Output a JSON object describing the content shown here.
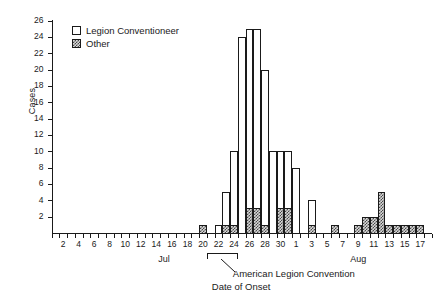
{
  "chart_data": {
    "type": "bar",
    "title": "",
    "xlabel": "Date of Onset",
    "ylabel": "Cases",
    "ylim": [
      0,
      26
    ],
    "ytick_step": 2,
    "grid": false,
    "legend_position": "top-left",
    "stacked": true,
    "legend": [
      "Legion Conventioneer",
      "Other"
    ],
    "x_axis_months": [
      {
        "label": "Jul",
        "start_day": 1,
        "end_day": 31
      },
      {
        "label": "Aug",
        "start_day": 1,
        "end_day": 18
      }
    ],
    "x_tick_labels": [
      "2",
      "4",
      "6",
      "8",
      "10",
      "12",
      "14",
      "16",
      "18",
      "20",
      "22",
      "24",
      "26",
      "28",
      "30",
      "1",
      "3",
      "5",
      "7",
      "9",
      "11",
      "13",
      "15",
      "17"
    ],
    "categories": [
      "Jul 1",
      "Jul 2",
      "Jul 3",
      "Jul 4",
      "Jul 5",
      "Jul 6",
      "Jul 7",
      "Jul 8",
      "Jul 9",
      "Jul 10",
      "Jul 11",
      "Jul 12",
      "Jul 13",
      "Jul 14",
      "Jul 15",
      "Jul 16",
      "Jul 17",
      "Jul 18",
      "Jul 19",
      "Jul 20",
      "Jul 21",
      "Jul 22",
      "Jul 23",
      "Jul 24",
      "Jul 25",
      "Jul 26",
      "Jul 27",
      "Jul 28",
      "Jul 29",
      "Jul 30",
      "Jul 31",
      "Aug 1",
      "Aug 2",
      "Aug 3",
      "Aug 4",
      "Aug 5",
      "Aug 6",
      "Aug 7",
      "Aug 8",
      "Aug 9",
      "Aug 10",
      "Aug 11",
      "Aug 12",
      "Aug 13",
      "Aug 14",
      "Aug 15",
      "Aug 16",
      "Aug 17",
      "Aug 18"
    ],
    "series": [
      {
        "name": "Other",
        "values": [
          0,
          0,
          0,
          0,
          0,
          0,
          0,
          0,
          0,
          0,
          0,
          0,
          0,
          0,
          0,
          0,
          0,
          0,
          0,
          1,
          0,
          0,
          1,
          1,
          0,
          3,
          3,
          1,
          0,
          3,
          3,
          0,
          0,
          1,
          0,
          0,
          1,
          0,
          0,
          1,
          2,
          2,
          5,
          1,
          1,
          1,
          1,
          1,
          0
        ]
      },
      {
        "name": "Legion Conventioneer",
        "values": [
          0,
          0,
          0,
          0,
          0,
          0,
          0,
          0,
          0,
          0,
          0,
          0,
          0,
          0,
          0,
          0,
          0,
          0,
          0,
          0,
          0,
          1,
          4,
          9,
          24,
          22,
          22,
          19,
          10,
          7,
          7,
          8,
          0,
          3,
          0,
          0,
          0,
          0,
          0,
          0,
          0,
          0,
          0,
          0,
          0,
          0,
          0,
          0,
          0
        ]
      }
    ],
    "totals": [
      0,
      0,
      0,
      0,
      0,
      0,
      0,
      0,
      0,
      0,
      0,
      0,
      0,
      0,
      0,
      0,
      0,
      0,
      0,
      1,
      0,
      1,
      5,
      10,
      24,
      25,
      25,
      20,
      10,
      10,
      10,
      8,
      0,
      4,
      0,
      0,
      1,
      0,
      0,
      1,
      2,
      2,
      5,
      1,
      1,
      1,
      1,
      1,
      0
    ],
    "annotations": [
      {
        "name": "convention-bracket",
        "label": "American Legion Convention",
        "start": "Jul 21",
        "end": "Jul 24"
      },
      {
        "name": "x-axis-title",
        "label": "Date of Onset"
      }
    ]
  },
  "legend": {
    "item1": "Legion Conventioneer",
    "item2": "Other"
  },
  "axes": {
    "y_title": "Cases",
    "month_jul": "Jul",
    "month_aug": "Aug"
  },
  "annotations": {
    "convention": "American Legion Convention",
    "onset": "Date of Onset"
  }
}
